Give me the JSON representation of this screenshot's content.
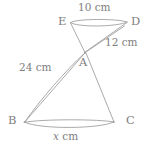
{
  "figure": {
    "kind": "geometry-diagram",
    "stroke_color": "#a0a0a0",
    "label_color": "#7e7e7e",
    "background_color": "#ffffff",
    "vertices": [
      {
        "id": "E",
        "label": "E",
        "x": 65,
        "y": 22
      },
      {
        "id": "D",
        "label": "D",
        "x": 130,
        "y": 22
      },
      {
        "id": "A",
        "label": "A",
        "x": 85,
        "y": 52
      },
      {
        "id": "B",
        "label": "B",
        "x": 24,
        "y": 122
      },
      {
        "id": "C",
        "label": "C",
        "x": 114,
        "y": 122
      }
    ],
    "dimensions": [
      {
        "id": "top",
        "text": "10 cm",
        "value": 10,
        "unit": "cm",
        "between": "E-D"
      },
      {
        "id": "slant",
        "text": "12 cm",
        "value": 12,
        "unit": "cm",
        "between": "D-A"
      },
      {
        "id": "left",
        "text": "24 cm",
        "value": 24,
        "unit": "cm",
        "between": "B-A"
      },
      {
        "id": "bottom",
        "text": "x cm",
        "value": "x",
        "unit": "cm",
        "between": "B-C",
        "italic_symbol": "x"
      }
    ],
    "bottom_dim_symbol": "x",
    "bottom_dim_unit": " cm"
  }
}
